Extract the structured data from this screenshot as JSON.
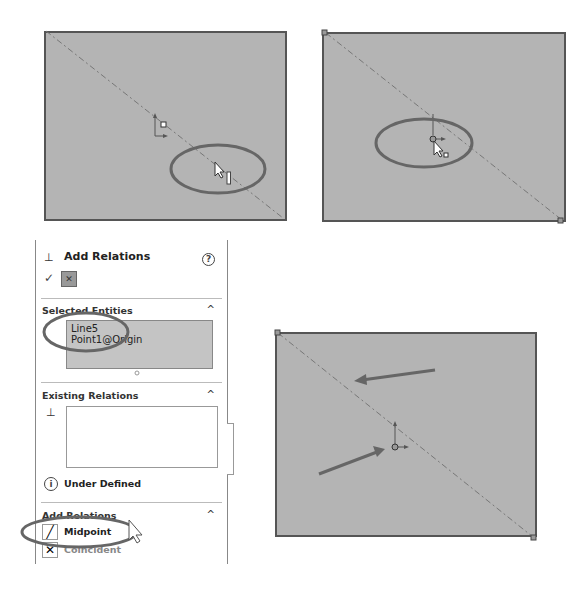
{
  "panels": {
    "top_left": {
      "description": "sketch rectangle with construction diagonal, cursor hovering near line midpoint",
      "highlight": "ellipse around cursor"
    },
    "top_right": {
      "description": "sketch rectangle with origin point, cursor at origin",
      "highlight": "ellipse around origin"
    },
    "bottom_right": {
      "description": "sketch rectangle with diagonal and origin, arrows pointing to diagonal and origin"
    }
  },
  "property_manager": {
    "title": "Add Relations",
    "help_icon": "?",
    "ok_icon": "checkmark-icon",
    "pin_icon": "pushpin-icon",
    "sections": {
      "selected_entities": {
        "title": "Selected Entities",
        "items": [
          "Line5",
          "Point1@Origin"
        ]
      },
      "existing_relations": {
        "title": "Existing Relations",
        "status": "Under Defined"
      },
      "add_relations": {
        "title": "Add Relations",
        "items": [
          "Midpoint",
          "Coincident"
        ]
      }
    }
  },
  "colors": {
    "canvas": "#b4b4b4",
    "edge": "#555555",
    "highlight": "#666666",
    "selected_box": "#c4c4c4"
  }
}
